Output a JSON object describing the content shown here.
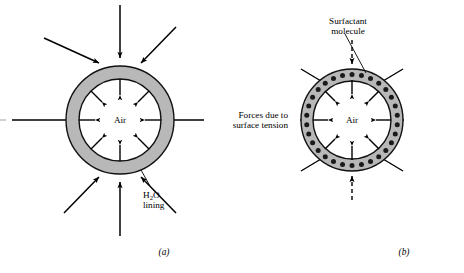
{
  "figure": {
    "title": "",
    "background_color": "#ffffff",
    "ink_color": "#000000",
    "lining_fill_color": "#b8b8b8",
    "lining_stroke_color": "#111111",
    "surfactant_dot_color": "#1a1a1a",
    "cavity_fill_color": "#ffffff"
  },
  "panels": [
    {
      "id": "a",
      "caption": "(a)",
      "center_label": "Air",
      "annotation": {
        "line1": "H₂O",
        "text_before_sub": "H",
        "subscript": "2",
        "text_after_sub": "O",
        "line2": "lining"
      },
      "outer_arrow_count": 8,
      "inner_arrow_count": 8,
      "outer_arrow_style": "solid",
      "inner_arrow_style": "solid",
      "has_surfactant": false,
      "surfactant_dot_count": 0
    },
    {
      "id": "b",
      "caption": "(b)",
      "center_label": "Air",
      "annotation": {
        "line1": "Surfactant",
        "line2": "molecule"
      },
      "outer_arrow_count": 8,
      "inner_arrow_count": 8,
      "outer_arrow_style": "mixed: cardinal dashed, diagonal solid",
      "inner_arrow_style": "solid",
      "has_surfactant": true,
      "surfactant_dot_count": 30
    }
  ],
  "shared_label": {
    "line1": "Forces due to",
    "line2": "surface tension"
  }
}
